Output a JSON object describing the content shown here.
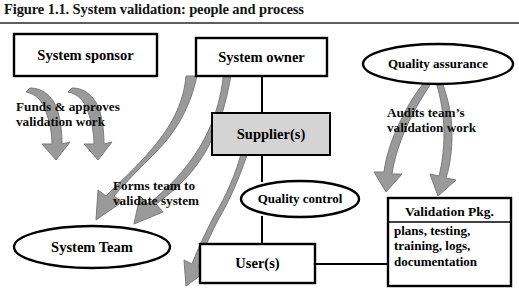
{
  "figure": {
    "caption": "Figure 1.1. System validation: people and process"
  },
  "diagram": {
    "nodes": [
      {
        "id": "system-sponsor",
        "label": "System sponsor",
        "shape": "rectangle",
        "fill": "#ffffff"
      },
      {
        "id": "system-owner",
        "label": "System owner",
        "shape": "rectangle",
        "fill": "#ffffff"
      },
      {
        "id": "supplier",
        "label": "Supplier(s)",
        "shape": "rectangle",
        "fill": "#d4d4d4"
      },
      {
        "id": "quality-assurance",
        "label": "Quality assurance",
        "shape": "ellipse",
        "fill": "#ffffff"
      },
      {
        "id": "quality-control",
        "label": "Quality control",
        "shape": "ellipse",
        "fill": "#ffffff"
      },
      {
        "id": "users",
        "label": "User(s)",
        "shape": "rectangle",
        "fill": "#ffffff"
      },
      {
        "id": "system-team",
        "label": "System Team",
        "shape": "ellipse",
        "fill": "#ffffff"
      }
    ],
    "validation_package": {
      "title": "Validation Pkg.",
      "items": [
        "plans, testing,",
        "training, logs,",
        "documentation"
      ]
    },
    "annotations": [
      {
        "id": "funds",
        "lines": [
          "Funds & approves",
          "validation work"
        ]
      },
      {
        "id": "forms",
        "lines": [
          "Forms team to",
          "validate system"
        ]
      },
      {
        "id": "audits",
        "lines": [
          "Audits team’s",
          "validation work"
        ]
      }
    ],
    "colors": {
      "arrow_fill": "#9a9a9a",
      "arrow_stroke": "#6f6f6f",
      "supplier_fill": "#d4d4d4",
      "box_stroke": "#000000",
      "rule": "#5e5e5e"
    }
  }
}
